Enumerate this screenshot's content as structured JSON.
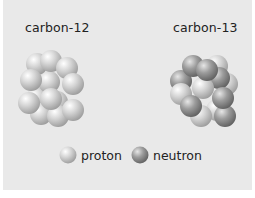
{
  "diagram": {
    "nuclei": [
      {
        "label": "carbon-12",
        "protons": 6,
        "neutrons": 6
      },
      {
        "label": "carbon-13",
        "protons": 6,
        "neutrons": 7
      }
    ],
    "legend": [
      {
        "label": "proton",
        "color": "#c8c8c8"
      },
      {
        "label": "neutron",
        "color": "#8f8f8f"
      }
    ],
    "colors": {
      "background": "#e9e9e9",
      "proton": "#c8c8c8",
      "neutron": "#8f8f8f"
    }
  }
}
